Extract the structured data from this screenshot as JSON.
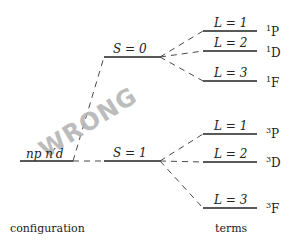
{
  "diagram": {
    "type": "term-splitting-diagram",
    "configuration": {
      "label_main": "np n′d",
      "label": "configuration"
    },
    "spin_levels": [
      {
        "label": "S = 0",
        "terms": [
          {
            "L_label": "L = 1",
            "term_sup": "1",
            "term_letter": "P"
          },
          {
            "L_label": "L = 2",
            "term_sup": "1",
            "term_letter": "D"
          },
          {
            "L_label": "L = 3",
            "term_sup": "1",
            "term_letter": "F"
          }
        ]
      },
      {
        "label": "S = 1",
        "terms": [
          {
            "L_label": "L = 1",
            "term_sup": "3",
            "term_letter": "P"
          },
          {
            "L_label": "L = 2",
            "term_sup": "3",
            "term_letter": "D"
          },
          {
            "L_label": "L = 3",
            "term_sup": "3",
            "term_letter": "F"
          }
        ]
      }
    ],
    "column_labels": {
      "left": "configuration",
      "right": "terms"
    },
    "watermark": "WRONG"
  }
}
